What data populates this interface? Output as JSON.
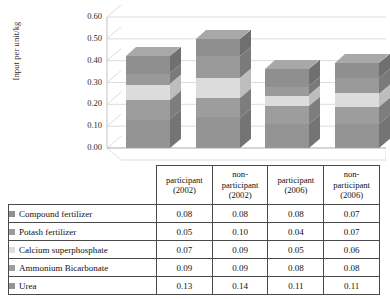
{
  "chart_data": {
    "type": "bar",
    "subtype": "stacked-3d-column",
    "title": "",
    "xlabel": "",
    "ylabel": "Input per unit/kg",
    "ylim": [
      0.0,
      0.6
    ],
    "ytick_labels": [
      "0.60",
      "0.50",
      "0.40",
      "0.30",
      "0.20",
      "0.10",
      "0.00"
    ],
    "ytick_values": [
      0.6,
      0.5,
      0.4,
      0.3,
      0.2,
      0.1,
      0.0
    ],
    "grid": true,
    "legend_position": "table-left-column",
    "categories": [
      {
        "line1": "participant",
        "line2": "(2002)",
        "line3": ""
      },
      {
        "line1": "non-",
        "line2": "participant",
        "line3": "(2002)"
      },
      {
        "line1": "participant",
        "line2": "(2006)",
        "line3": ""
      },
      {
        "line1": "non-",
        "line2": "participant",
        "line3": "(2006)"
      }
    ],
    "category_labels": [
      "participant (2002)",
      "non-participant (2002)",
      "participant (2006)",
      "non-participant (2006)"
    ],
    "series": [
      {
        "name": "Compound fertilizer",
        "color": "#8f8f8f",
        "side": "#6f6f6f",
        "top": "#a8a8a8",
        "values": [
          0.08,
          0.08,
          0.08,
          0.07
        ]
      },
      {
        "name": "Potash fertilizer",
        "color": "#9a9a9a",
        "side": "#7a7a7a",
        "top": "#b2b2b2",
        "values": [
          0.05,
          0.1,
          0.04,
          0.07
        ]
      },
      {
        "name": "Calcium superphosphate",
        "color": "#dcdcdc",
        "side": "#bdbdbd",
        "top": "#e9e9e9",
        "values": [
          0.07,
          0.09,
          0.05,
          0.06
        ]
      },
      {
        "name": "Ammonium Bicarbonate",
        "color": "#9d9d9d",
        "side": "#7d7d7d",
        "top": "#b4b4b4",
        "values": [
          0.09,
          0.09,
          0.08,
          0.08
        ]
      },
      {
        "name": "Urea",
        "color": "#949494",
        "side": "#747474",
        "top": "#ababab",
        "values": [
          0.13,
          0.14,
          0.11,
          0.11
        ]
      }
    ],
    "stack_order_bottom_to_top": [
      "Urea",
      "Ammonium Bicarbonate",
      "Calcium superphosphate",
      "Potash fertilizer",
      "Compound fertilizer"
    ],
    "totals": [
      0.42,
      0.5,
      0.36,
      0.39
    ]
  },
  "table": {
    "corner_label": "",
    "column_headers": [
      {
        "line1": "participant",
        "line2": "(2002)",
        "line3": ""
      },
      {
        "line1": "non-",
        "line2": "participant",
        "line3": "(2002)"
      },
      {
        "line1": "participant",
        "line2": "(2006)",
        "line3": ""
      },
      {
        "line1": "non-",
        "line2": "participant",
        "line3": "(2006)"
      }
    ],
    "rows": [
      {
        "label": "Compound fertilizer",
        "swatch": "#8f8f8f",
        "values": [
          "0.08",
          "0.08",
          "0.08",
          "0.07"
        ]
      },
      {
        "label": "Potash fertilizer",
        "swatch": "#9a9a9a",
        "values": [
          "0.05",
          "0.10",
          "0.04",
          "0.07"
        ]
      },
      {
        "label": "Calcium superphosphate",
        "swatch": "#dcdcdc",
        "values": [
          "0.07",
          "0.09",
          "0.05",
          "0.06"
        ]
      },
      {
        "label": "Ammonium Bicarbonate",
        "swatch": "#9d9d9d",
        "values": [
          "0.09",
          "0.09",
          "0.08",
          "0.08"
        ]
      },
      {
        "label": "Urea",
        "swatch": "#949494",
        "values": [
          "0.13",
          "0.14",
          "0.11",
          "0.11"
        ]
      }
    ]
  }
}
